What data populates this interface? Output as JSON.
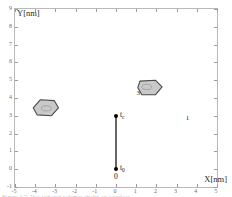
{
  "figure": {
    "background_color": "#ffffff",
    "frame_color": "#b9b9b9",
    "caption_partial": "Figure 4.7:  Two tethered polymer chains on a surface"
  },
  "axes": {
    "x_title": "X[nm]",
    "y_title": "Y[nm]",
    "x_ticks": [
      "-5",
      "-4",
      "-3",
      "-2",
      "-1",
      "0",
      "1",
      "2",
      "3",
      "4",
      "5"
    ],
    "y_ticks": [
      "-1",
      "0",
      "1",
      "2",
      "3",
      "4",
      "5",
      "6",
      "7",
      "8",
      "9"
    ],
    "xlim": [
      -5,
      5
    ],
    "ylim": [
      -1,
      9
    ],
    "grid": false
  },
  "chart_data": {
    "type": "scatter",
    "title": "",
    "xlabel": "X[nm]",
    "ylabel": "Y[nm]",
    "xlim": [
      -5,
      5
    ],
    "ylim": [
      -1,
      9
    ],
    "xticks": [
      -5,
      -4,
      -3,
      -2,
      -1,
      0,
      1,
      2,
      3,
      4,
      5
    ],
    "yticks": [
      -1,
      0,
      1,
      2,
      3,
      4,
      5,
      6,
      7,
      8,
      9
    ],
    "grid": false,
    "legend": "none",
    "shapes": [
      {
        "id": "1",
        "label": "1",
        "label_x": 3.45,
        "label_y": 3.05,
        "center_x": -3.45,
        "center_y": 3.42,
        "fill": "#c9c9c9",
        "stroke": "#4a4a4a",
        "vertices_nm": [
          [
            -4.1,
            3.45
          ],
          [
            -3.75,
            3.9
          ],
          [
            -3.05,
            3.85
          ],
          [
            -2.85,
            3.45
          ],
          [
            -3.2,
            3.0
          ],
          [
            -3.9,
            3.05
          ]
        ]
      },
      {
        "id": "3",
        "label": "3",
        "label_x": 1.02,
        "label_y": 4.45,
        "center_x": 1.52,
        "center_y": 4.62,
        "fill": "#c9c9c9",
        "stroke": "#4a4a4a",
        "vertices_nm": [
          [
            1.18,
            4.95
          ],
          [
            1.95,
            5.0
          ],
          [
            2.28,
            4.62
          ],
          [
            1.95,
            4.18
          ],
          [
            1.28,
            4.18
          ],
          [
            1.08,
            4.58
          ]
        ]
      }
    ],
    "tether": {
      "color": "#000000",
      "x": 0.0,
      "y_start": 0.0,
      "y_end": 3.0,
      "endpoints": [
        {
          "name": "t_c",
          "label": "t",
          "subscript": "c",
          "x": 0.0,
          "y": 3.0
        },
        {
          "name": "t_0",
          "label": "t",
          "subscript": "0",
          "x": 0.0,
          "y": 0.0
        }
      ],
      "origin_label": "0"
    }
  }
}
